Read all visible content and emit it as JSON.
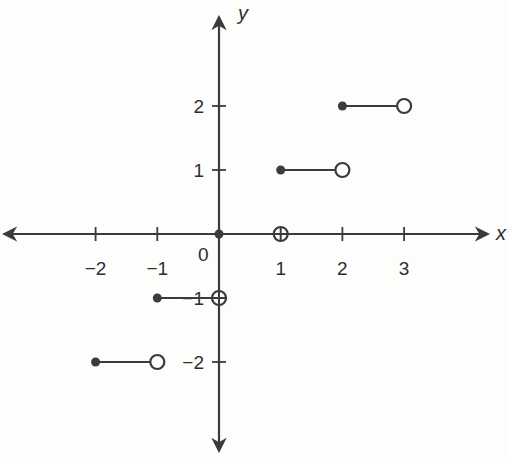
{
  "chart_data": {
    "type": "line",
    "title": "",
    "xlabel": "x",
    "ylabel": "y",
    "xlim": [
      -3.3,
      4.2
    ],
    "ylim": [
      -3.3,
      3.4
    ],
    "grid": false,
    "legend": null,
    "origin_label": "0",
    "x_ticks": [
      -2,
      -1,
      1,
      2,
      3
    ],
    "x_tick_labels": [
      "−2",
      "−1",
      "1",
      "2",
      "3"
    ],
    "y_ticks": [
      -2,
      -1,
      1,
      2
    ],
    "y_tick_labels": [
      "−2",
      "−1",
      "1",
      "2"
    ],
    "segments": [
      {
        "x_start": -2,
        "x_end": -1,
        "y": -2,
        "start": "closed",
        "end": "open"
      },
      {
        "x_start": -1,
        "x_end": 0,
        "y": -1,
        "start": "closed",
        "end": "open"
      },
      {
        "x_start": 0,
        "x_end": 1,
        "y": 0,
        "start": "closed",
        "end": "open"
      },
      {
        "x_start": 1,
        "x_end": 2,
        "y": 1,
        "start": "closed",
        "end": "open"
      },
      {
        "x_start": 2,
        "x_end": 3,
        "y": 2,
        "start": "closed",
        "end": "open"
      }
    ]
  },
  "style": {
    "line_color": "#3b3b3b",
    "background": "#fdfdfc"
  },
  "layout": {
    "origin_px": [
      219,
      234
    ],
    "unit_x_px": 61.7,
    "unit_y_px": 64,
    "x_axis_px": [
      5,
      487
    ],
    "y_axis_px": [
      18,
      450
    ]
  }
}
